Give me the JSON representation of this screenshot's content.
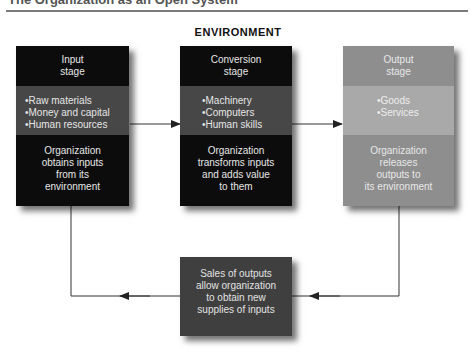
{
  "header": {
    "title": "The Organization as an Open System",
    "environment_label": "ENVIRONMENT"
  },
  "stages": [
    {
      "id": "input",
      "title": "Input stage",
      "title_lines": [
        "Input",
        "stage"
      ],
      "items": [
        "•Raw materials",
        "•Money and capital",
        "•Human resources"
      ],
      "description_lines": [
        "Organization",
        "obtains inputs",
        "from its",
        "environment"
      ]
    },
    {
      "id": "conversion",
      "title": "Conversion stage",
      "title_lines": [
        "Conversion",
        "stage"
      ],
      "items": [
        "•Machinery",
        "•Computers",
        "•Human skills"
      ],
      "description_lines": [
        "Organization",
        "transforms inputs",
        "and adds value",
        "to them"
      ]
    },
    {
      "id": "output",
      "title": "Output stage",
      "title_lines": [
        "Output",
        "stage"
      ],
      "items": [
        "•Goods",
        "•Services"
      ],
      "description_lines": [
        "Organization",
        "releases",
        "outputs to",
        "its environment"
      ]
    }
  ],
  "feedback": {
    "lines": [
      "Sales of outputs",
      "allow organization",
      "to obtain new",
      "supplies of inputs"
    ]
  },
  "colors": {
    "dark_band": "#0c0c0c",
    "dark_mid_band": "#474747",
    "light_band": "#8e8e8e",
    "light_mid_band": "#a9a9a9",
    "feedback_box": "#3f3f3f",
    "arrow": "#222222"
  },
  "flow": [
    {
      "from": "input",
      "to": "conversion"
    },
    {
      "from": "conversion",
      "to": "output"
    },
    {
      "from": "output",
      "to": "feedback"
    },
    {
      "from": "feedback",
      "to": "input"
    }
  ]
}
